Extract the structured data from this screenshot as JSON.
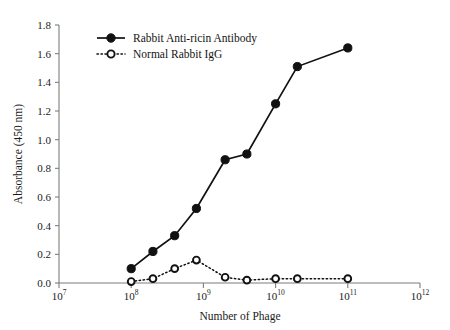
{
  "chart_data": {
    "type": "line",
    "title": "",
    "xlabel": "Number of Phage",
    "ylabel": "Absorbance (450 nm)",
    "xscale": "log",
    "xlim": [
      10000000.0,
      1000000000000.0
    ],
    "ylim": [
      0.0,
      1.8
    ],
    "grid": false,
    "legend_position": "top-left-inside",
    "x_tick_labels": [
      "10^7",
      "10^8",
      "10^9",
      "10^10",
      "10^11",
      "10^12"
    ],
    "x_tick_bases": [
      "10",
      "10",
      "10",
      "10",
      "10",
      "10"
    ],
    "x_tick_exponents": [
      "7",
      "8",
      "9",
      "10",
      "11",
      "12"
    ],
    "x_tick_values": [
      10000000.0,
      100000000.0,
      1000000000.0,
      10000000000.0,
      100000000000.0,
      1000000000000.0
    ],
    "y_tick_labels": [
      "0.0",
      "0.2",
      "0.4",
      "0.6",
      "0.8",
      "1.0",
      "1.2",
      "1.4",
      "1.6",
      "1.8"
    ],
    "y_tick_values": [
      0.0,
      0.2,
      0.4,
      0.6,
      0.8,
      1.0,
      1.2,
      1.4,
      1.6,
      1.8
    ],
    "x": [
      100000000.0,
      200000000.0,
      400000000.0,
      800000000.0,
      2000000000.0,
      4000000000.0,
      10000000000.0,
      20000000000.0,
      100000000000.0
    ],
    "series": [
      {
        "name": "Rabbit Anti-ricin Antibody",
        "marker": "filled-circle",
        "line": "solid",
        "color": "#111111",
        "values": [
          0.1,
          0.22,
          0.33,
          0.52,
          0.86,
          0.9,
          1.25,
          1.51,
          1.64
        ]
      },
      {
        "name": "Normal Rabbit IgG",
        "marker": "open-circle",
        "line": "dotted",
        "color": "#111111",
        "values": [
          0.01,
          0.03,
          0.1,
          0.16,
          0.04,
          0.02,
          0.03,
          0.03,
          0.03
        ]
      }
    ]
  },
  "legend": {
    "entries": [
      {
        "label": "Rabbit Anti-ricin Antibody"
      },
      {
        "label": "Normal Rabbit IgG"
      }
    ]
  },
  "axes": {
    "x_title": "Number of Phage",
    "y_title": "Absorbance (450 nm)"
  }
}
